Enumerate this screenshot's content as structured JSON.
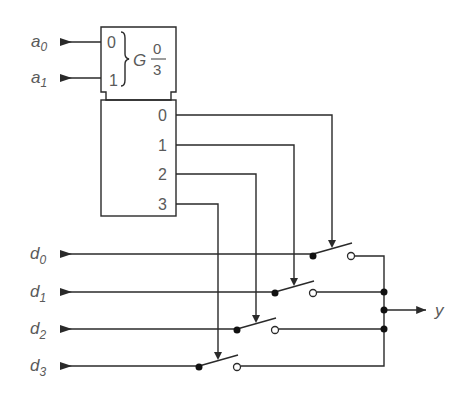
{
  "diagram": {
    "type": "4-to-1 multiplexer using 1-of-4 decoder and analog switches",
    "colors": {
      "line": "#2a2a2a",
      "text": "#5a5a5a",
      "background": "#ffffff"
    },
    "address_inputs": [
      {
        "name": "a",
        "sub": "0",
        "pin": "0"
      },
      {
        "name": "a",
        "sub": "1",
        "pin": "1"
      }
    ],
    "control_block": {
      "qualifier": "G",
      "range_top": "0",
      "range_bottom": "3"
    },
    "decoder_outputs": [
      "0",
      "1",
      "2",
      "3"
    ],
    "data_inputs": [
      {
        "name": "d",
        "sub": "0"
      },
      {
        "name": "d",
        "sub": "1"
      },
      {
        "name": "d",
        "sub": "2"
      },
      {
        "name": "d",
        "sub": "3"
      }
    ],
    "output": {
      "name": "y"
    }
  }
}
